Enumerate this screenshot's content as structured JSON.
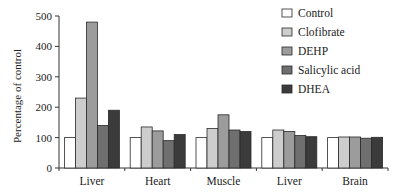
{
  "chart_data": {
    "type": "bar",
    "title": "",
    "xlabel": "",
    "ylabel": "Percentage of control",
    "ylim": [
      0,
      500
    ],
    "yticks": [
      0,
      100,
      200,
      300,
      400,
      500
    ],
    "grid": false,
    "legend_position": "upper right",
    "categories": [
      "Liver",
      "Heart",
      "Muscle",
      "Liver",
      "Brain"
    ],
    "series": [
      {
        "name": "Control",
        "color": "#ffffff",
        "values": [
          100,
          100,
          100,
          100,
          100
        ]
      },
      {
        "name": "Clofibrate",
        "color": "#cdcdcd",
        "values": [
          230,
          135,
          130,
          125,
          102
        ]
      },
      {
        "name": "DEHP",
        "color": "#9c9c9c",
        "values": [
          480,
          122,
          175,
          120,
          102
        ]
      },
      {
        "name": "Salicylic acid",
        "color": "#6f6f6f",
        "values": [
          140,
          90,
          125,
          107,
          98
        ]
      },
      {
        "name": "DHEA",
        "color": "#3b3b3b",
        "values": [
          190,
          110,
          120,
          103,
          101
        ]
      }
    ]
  }
}
